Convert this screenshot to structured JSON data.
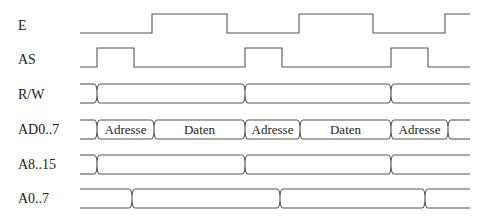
{
  "diagram": {
    "x_start": 80,
    "x_end": 470,
    "signals": [
      {
        "name": "E",
        "type": "clock",
        "label_y": 30,
        "low_y": 33,
        "high_y": 14,
        "initial": "low",
        "edges": [
          152,
          227,
          299,
          373,
          445
        ]
      },
      {
        "name": "AS",
        "type": "clock",
        "label_y": 64,
        "low_y": 67,
        "high_y": 48,
        "initial": "low",
        "edges": [
          97,
          134,
          245,
          282,
          391,
          428
        ]
      },
      {
        "name": "R/W",
        "type": "bus",
        "label_y": 99,
        "top_y": 84,
        "bottom_y": 103,
        "transitions": [
          97,
          245,
          391
        ],
        "cells": []
      },
      {
        "name": "AD0..7",
        "type": "bus",
        "label_y": 134,
        "top_y": 120,
        "bottom_y": 139,
        "transitions": [
          97,
          154,
          245,
          300,
          391,
          448
        ],
        "cells": [
          {
            "from": 97,
            "to": 154,
            "text": "Adresse"
          },
          {
            "from": 154,
            "to": 245,
            "text": "Daten"
          },
          {
            "from": 245,
            "to": 300,
            "text": "Adresse"
          },
          {
            "from": 300,
            "to": 391,
            "text": "Daten"
          },
          {
            "from": 391,
            "to": 448,
            "text": "Adresse"
          }
        ]
      },
      {
        "name": "A8..15",
        "type": "bus",
        "label_y": 169,
        "top_y": 155,
        "bottom_y": 174,
        "transitions": [
          97,
          245,
          391
        ],
        "cells": []
      },
      {
        "name": "A0..7",
        "type": "bus",
        "label_y": 203,
        "top_y": 189,
        "bottom_y": 208,
        "transitions": [
          132,
          280,
          425
        ],
        "cells": []
      }
    ]
  }
}
